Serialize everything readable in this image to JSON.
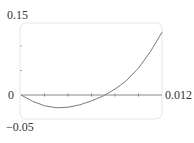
{
  "chart_data": {
    "type": "line",
    "title": "",
    "xlabel": "",
    "ylabel": "",
    "xlim": [
      0,
      0.012
    ],
    "ylim": [
      -0.05,
      0.15
    ],
    "grid": false,
    "legend": null,
    "x_ticks": [
      0.002,
      0.004,
      0.006,
      0.008,
      0.01
    ],
    "y_ticks": [
      0.05,
      0.1
    ],
    "tick_labels": {
      "y_top": "0.15",
      "y_zero": "0",
      "y_bottom": "−0.05",
      "x_right": "0.012"
    },
    "series": [
      {
        "name": "f(x)",
        "x": [
          0,
          0.001,
          0.002,
          0.003,
          0.004,
          0.005,
          0.006,
          0.007,
          0.008,
          0.009,
          0.01,
          0.011,
          0.012
        ],
        "values": [
          0,
          -0.013,
          -0.022,
          -0.026,
          -0.025,
          -0.02,
          -0.012,
          -0.002,
          0.012,
          0.03,
          0.055,
          0.088,
          0.128
        ]
      }
    ],
    "colors": {
      "curve": "#7a7a7a",
      "axis": "#888888",
      "frame": "#e6e6e6"
    }
  }
}
